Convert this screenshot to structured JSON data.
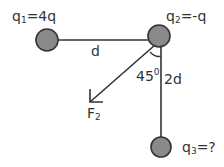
{
  "diagram": {
    "title": "",
    "charges": [
      {
        "id": "q1",
        "label_main": "q",
        "label_sub": "1",
        "label_value": "=4q"
      },
      {
        "id": "q2",
        "label_main": "q",
        "label_sub": "2",
        "label_value": "=-q"
      },
      {
        "id": "q3",
        "label_main": "q",
        "label_sub": "3",
        "label_value": "=?"
      }
    ],
    "distances": {
      "q1_q2": "d",
      "q2_q3": "2d"
    },
    "angle": {
      "value": "45",
      "unit": "0"
    },
    "force": {
      "main": "F",
      "sub": "2"
    },
    "colors": {
      "charge_fill": "#8a8a8a",
      "charge_stroke": "#333333",
      "line": "#333333",
      "text": "#333333"
    }
  }
}
